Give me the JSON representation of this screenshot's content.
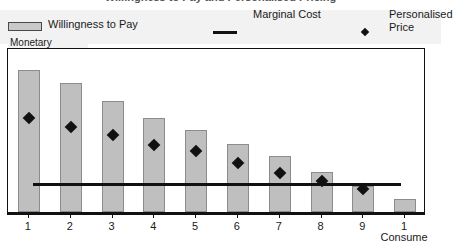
{
  "title": "Willingness to Pay and Personalised Pricing",
  "legend": {
    "willingness_label": "Willingness to Pay",
    "marginal_cost_label": "Marginal Cost",
    "personalised_price_label": "Personalised\nPrice",
    "personalised_price_line1": "Personalised",
    "personalised_price_line2": "Price",
    "swatch_bar_fill": "#c9c9c9",
    "swatch_line_color": "#111111",
    "swatch_diamond_color": "#111111"
  },
  "axes": {
    "ylabel": "Monetary",
    "xlabel": "Consumer",
    "xlabel_visible": "Consume"
  },
  "chart_data": {
    "type": "bar",
    "title": "Willingness to Pay and Personalised Pricing",
    "xlabel": "Consumer",
    "ylabel": "Monetary",
    "categories": [
      "1",
      "2",
      "3",
      "4",
      "5",
      "6",
      "7",
      "8",
      "9",
      "10"
    ],
    "tick_labels_visible": [
      "1",
      "2",
      "3",
      "4",
      "5",
      "6",
      "7",
      "8",
      "9",
      "1"
    ],
    "ylim": [
      0,
      100
    ],
    "grid": false,
    "legend_position": "top",
    "series": [
      {
        "name": "Willingness to Pay",
        "type": "bar",
        "color": "#bfbfbf",
        "edge_color": "#8c8c8c",
        "values": [
          86,
          78,
          67,
          57,
          50,
          41,
          34,
          24,
          16,
          8
        ]
      },
      {
        "name": "Personalised Price",
        "type": "scatter",
        "marker": "diamond",
        "color": "#111111",
        "values": [
          58,
          53,
          48,
          42,
          38,
          31,
          25,
          20,
          15,
          null
        ]
      },
      {
        "name": "Marginal Cost",
        "type": "line",
        "color": "#111111",
        "value": 16,
        "x_start": 0.6,
        "x_end": 9.4
      }
    ]
  }
}
